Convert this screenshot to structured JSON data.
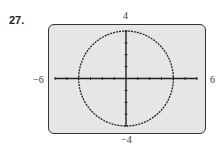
{
  "problem_number": "27.",
  "window": {
    "xmin_label": "−6",
    "xmax_label": "6",
    "ymin_label": "−4",
    "ymax_label": "4"
  },
  "chart_data": {
    "type": "line",
    "title": "",
    "xlim": [
      -6,
      6
    ],
    "ylim": [
      -4,
      4
    ],
    "xscale": 1,
    "yscale": 1,
    "series": [
      {
        "name": "circle",
        "center": [
          0,
          0
        ],
        "radius": 4,
        "style": "dotted"
      }
    ],
    "xlabel": "",
    "ylabel": "",
    "grid": false
  }
}
